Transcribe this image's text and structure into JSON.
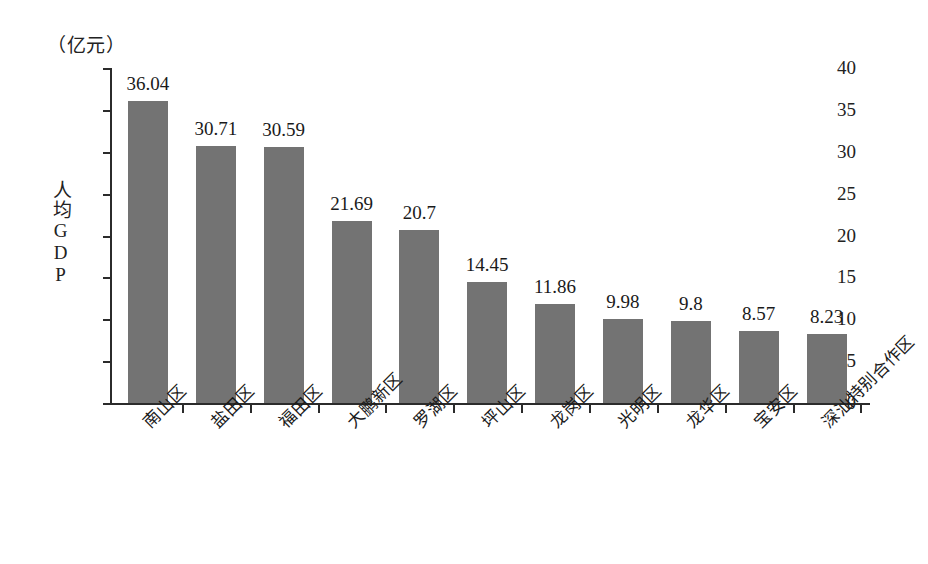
{
  "chart_data": {
    "type": "bar",
    "title": "",
    "subtitle": "",
    "unit_caption": "（亿元）",
    "xlabel": "",
    "ylabel": "人均GDP",
    "ylim": [
      0,
      40
    ],
    "yticks": [
      0,
      5,
      10,
      15,
      20,
      25,
      30,
      35,
      40
    ],
    "ytick_labels": [
      "0",
      "5",
      "10",
      "15",
      "20",
      "25",
      "30",
      "35",
      "40"
    ],
    "grid": false,
    "legend": false,
    "legend_position": "none",
    "bar_color": "#737373",
    "axis_color": "#2b2b2b",
    "background_color": "#ffffff",
    "categories": [
      "南山区",
      "盐田区",
      "福田区",
      "大鹏新区",
      "罗湖区",
      "坪山区",
      "龙岗区",
      "光明区",
      "龙华区",
      "宝安区",
      "深汕特别合作区"
    ],
    "values": [
      36.04,
      30.71,
      30.59,
      21.69,
      20.7,
      14.45,
      11.86,
      9.98,
      9.8,
      8.57,
      8.23
    ],
    "value_labels": [
      "36.04",
      "30.71",
      "30.59",
      "21.69",
      "20.7",
      "14.45",
      "11.86",
      "9.98",
      "9.8",
      "8.57",
      "8.23"
    ]
  }
}
